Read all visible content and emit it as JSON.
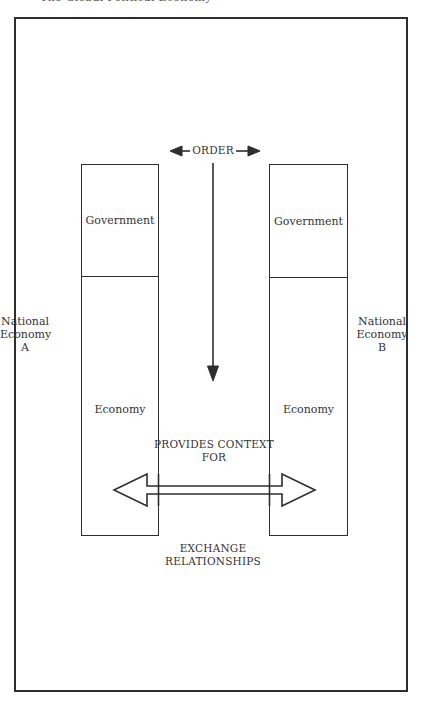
{
  "header": {
    "clipped_title": "The Global Political Economy"
  },
  "diagram": {
    "order_label": "ORDER",
    "provides_label_line1": "PROVIDES CONTEXT",
    "provides_label_line2": "FOR",
    "exchange_label_line1": "EXCHANGE",
    "exchange_label_line2": "RELATIONSHIPS",
    "left": {
      "title_line1": "National",
      "title_line2": "Economy",
      "title_line3": "A",
      "top_box": "Government",
      "bottom_box": "Economy"
    },
    "right": {
      "title_line1": "National",
      "title_line2": "Economy",
      "title_line3": "B",
      "top_box": "Government",
      "bottom_box": "Economy"
    },
    "colors": {
      "line": "#2e2e2e",
      "background": "#ffffff"
    }
  }
}
